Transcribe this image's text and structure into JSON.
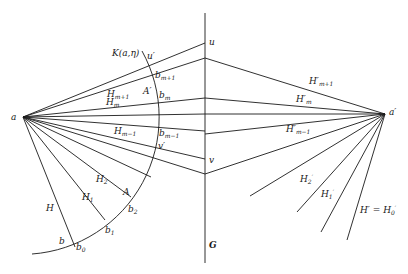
{
  "diagram": {
    "points": {
      "a": {
        "label": "a",
        "x": 23,
        "y": 117
      },
      "a_prime": {
        "label": "a′",
        "x": 385,
        "y": 114
      },
      "u": {
        "label": "u"
      },
      "v": {
        "label": "v"
      },
      "u_prime": {
        "label": "u′"
      },
      "v_prime": {
        "label": "v′"
      },
      "b": {
        "label": "b"
      },
      "b0": {
        "label": "b",
        "sub": "0"
      },
      "b1": {
        "label": "b",
        "sub": "1"
      },
      "b2": {
        "label": "b",
        "sub": "2"
      },
      "bm": {
        "label": "b",
        "sub": "m"
      },
      "bm_plus_1": {
        "label": "b",
        "sub": "m+1"
      },
      "bm_minus_1": {
        "label": "b",
        "sub": "m−1"
      }
    },
    "lines": {
      "G": {
        "label": "G"
      },
      "H": {
        "label": "H"
      },
      "H1": {
        "label": "H",
        "sub": "1"
      },
      "H2": {
        "label": "H",
        "sub": "2"
      },
      "Hm": {
        "label": "H",
        "sub": "m"
      },
      "Hm_plus_1": {
        "label": "H",
        "sub": "m+1"
      },
      "Hm_minus_1": {
        "label": "H",
        "sub": "m−1"
      },
      "Hp_m": {
        "label": "H′",
        "sub": "m"
      },
      "Hp_m_plus_1": {
        "label": "H′",
        "sub": "m+1"
      },
      "Hp_m_minus_1": {
        "label": "H′",
        "sub": "m−1"
      },
      "Hp_1": {
        "label": "H",
        "sub": "1",
        "sup": "′"
      },
      "Hp_2": {
        "label": "H",
        "sub": "2",
        "sup": "′"
      },
      "Hp_eq": {
        "label": "H′ = H",
        "sub": "0",
        "sup": "′"
      }
    },
    "regions": {
      "A": {
        "label": "A"
      },
      "A_prime": {
        "label": "A′"
      }
    },
    "arc": {
      "label": "K(a,η)"
    }
  }
}
